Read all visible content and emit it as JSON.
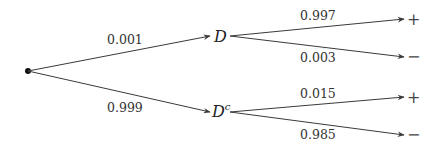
{
  "diagram": {
    "type": "probability-tree",
    "root": {
      "label": ""
    },
    "level1": [
      {
        "node": "D",
        "prob": "0.001"
      },
      {
        "node": "D",
        "superscript": "c",
        "prob": "0.999"
      }
    ],
    "level2": [
      {
        "parent": "D",
        "outcome": "+",
        "prob": "0.997"
      },
      {
        "parent": "D",
        "outcome": "−",
        "prob": "0.003"
      },
      {
        "parent": "Dc",
        "outcome": "+",
        "prob": "0.015"
      },
      {
        "parent": "Dc",
        "outcome": "−",
        "prob": "0.985"
      }
    ]
  }
}
